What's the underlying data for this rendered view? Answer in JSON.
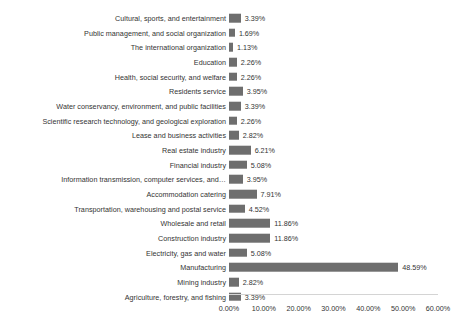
{
  "chart_data": {
    "type": "bar",
    "orientation": "horizontal",
    "title": "",
    "subtitle": "",
    "xlabel": "",
    "ylabel": "",
    "xlim": [
      0,
      60
    ],
    "xtick_labels": [
      "0.00%",
      "10.00%",
      "20.00%",
      "30.00%",
      "40.00%",
      "50.00%",
      "60.00%"
    ],
    "xtick_values": [
      0,
      10,
      20,
      30,
      40,
      50,
      60
    ],
    "grid": false,
    "legend": "none",
    "bar_color": "#6e6e6e",
    "axis_color": "#d4d4d4",
    "text_color": "#333333",
    "background_color": "#ffffff",
    "categories": [
      "Cultural, sports, and entertainment",
      "Public management, and social organization",
      "The international organization",
      "Education",
      "Health, social security, and welfare",
      "Residents service",
      "Water conservancy, environment, and public facilities",
      "Scientific research technology, and geological exploration",
      "Lease and business activities",
      "Real estate industry",
      "Financial industry",
      "Information transmission, computer services, and…",
      "Accommodation catering",
      "Transportation, warehousing and postal service",
      "Wholesale and retail",
      "Construction industry",
      "Electricity, gas and water",
      "Manufacturing",
      "Mining industry",
      "Agriculture, forestry, and fishing"
    ],
    "values": [
      3.39,
      1.69,
      1.13,
      2.26,
      2.26,
      3.95,
      3.39,
      2.26,
      2.82,
      6.21,
      5.08,
      3.95,
      7.91,
      4.52,
      11.86,
      11.86,
      5.08,
      48.59,
      2.82,
      3.39
    ],
    "value_labels": [
      "3.39%",
      "1.69%",
      "1.13%",
      "2.26%",
      "2.26%",
      "3.95%",
      "3.39%",
      "2.26%",
      "2.82%",
      "6.21%",
      "5.08%",
      "3.95%",
      "7.91%",
      "4.52%",
      "11.86%",
      "11.86%",
      "5.08%",
      "48.59%",
      "2.82%",
      "3.39%"
    ]
  }
}
